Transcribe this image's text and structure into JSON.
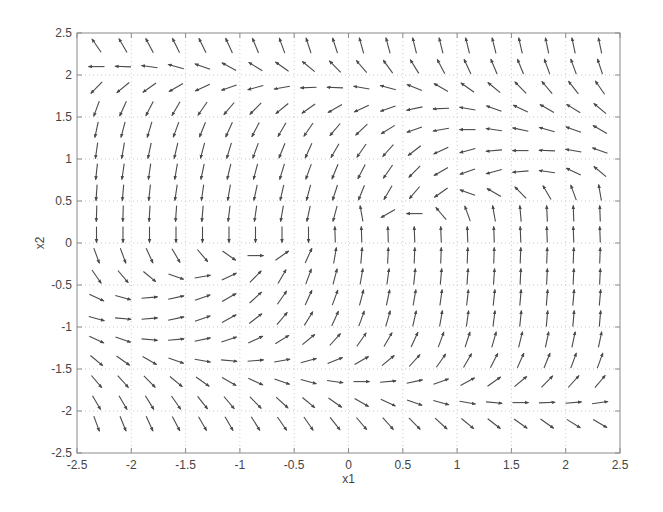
{
  "chart_data": {
    "type": "quiver",
    "title": "",
    "xlabel": "x1",
    "ylabel": "x2",
    "xlim": [
      -2.5,
      2.5
    ],
    "ylim": [
      -2.5,
      2.5
    ],
    "grid": true,
    "legend": null,
    "xticks": [
      -2.5,
      -2,
      -1.5,
      -1,
      -0.5,
      0,
      0.5,
      1,
      1.5,
      2,
      2.5
    ],
    "yticks": [
      -2.5,
      -2,
      -1.5,
      -1,
      -0.5,
      0,
      0.5,
      1,
      1.5,
      2,
      2.5
    ],
    "xtick_labels": [
      "-2.5",
      "-2",
      "-1.5",
      "-1",
      "-0.5",
      "0",
      "0.5",
      "1",
      "1.5",
      "2",
      "2.5"
    ],
    "ytick_labels": [
      "-2.5",
      "-2",
      "-1.5",
      "-1",
      "-0.5",
      "0",
      "0.5",
      "1",
      "1.5",
      "2",
      "2.5"
    ],
    "arrow_grid": {
      "x_start": -2.32,
      "x_step": 0.244,
      "nx": 20,
      "y_start": 2.35,
      "y_step": -0.25,
      "ny": 19,
      "note": "angles in degrees, 0 = +x1 (right), 90 = +x2 (up); rows top to bottom",
      "angles_deg": [
        [
          125,
          120,
          118,
          116,
          116,
          115,
          112,
          110,
          108,
          108,
          106,
          105,
          104,
          104,
          104,
          104,
          103,
          102,
          102,
          102
        ],
        [
          180,
          178,
          172,
          165,
          160,
          152,
          148,
          145,
          140,
          135,
          130,
          126,
          122,
          118,
          115,
          113,
          112,
          110,
          110,
          108
        ],
        [
          225,
          220,
          215,
          210,
          205,
          200,
          195,
          190,
          182,
          178,
          170,
          165,
          158,
          150,
          145,
          140,
          135,
          130,
          128,
          125
        ],
        [
          250,
          245,
          243,
          240,
          235,
          230,
          225,
          220,
          215,
          210,
          205,
          200,
          192,
          182,
          170,
          160,
          155,
          150,
          148,
          140
        ],
        [
          258,
          255,
          253,
          250,
          248,
          245,
          243,
          240,
          235,
          230,
          223,
          212,
          200,
          190,
          180,
          172,
          168,
          165,
          160,
          150
        ],
        [
          262,
          260,
          258,
          257,
          255,
          253,
          250,
          248,
          245,
          240,
          235,
          228,
          218,
          205,
          195,
          185,
          180,
          178,
          170,
          160
        ],
        [
          264,
          262,
          262,
          260,
          258,
          257,
          255,
          253,
          250,
          248,
          243,
          235,
          225,
          210,
          200,
          195,
          185,
          172,
          155,
          140
        ],
        [
          266,
          265,
          264,
          262,
          262,
          260,
          258,
          257,
          255,
          252,
          248,
          240,
          230,
          215,
          160,
          150,
          135,
          120,
          110,
          100
        ],
        [
          268,
          268,
          267,
          266,
          265,
          263,
          262,
          260,
          258,
          255,
          100,
          210,
          180,
          130,
          110,
          100,
          95,
          93,
          92,
          92
        ],
        [
          270,
          270,
          270,
          270,
          270,
          270,
          270,
          270,
          270,
          92,
          92,
          92,
          92,
          92,
          92,
          92,
          92,
          92,
          92,
          92
        ],
        [
          290,
          290,
          295,
          300,
          310,
          325,
          0,
          35,
          65,
          80,
          85,
          87,
          88,
          88,
          88,
          88,
          88,
          88,
          88,
          88
        ],
        [
          305,
          310,
          320,
          340,
          10,
          25,
          45,
          60,
          70,
          75,
          80,
          82,
          84,
          85,
          86,
          86,
          87,
          87,
          87,
          87
        ],
        [
          335,
          345,
          5,
          12,
          20,
          30,
          42,
          55,
          65,
          70,
          75,
          78,
          80,
          82,
          83,
          84,
          85,
          85,
          85,
          85
        ],
        [
          345,
          355,
          5,
          12,
          20,
          28,
          38,
          50,
          58,
          65,
          70,
          74,
          77,
          80,
          82,
          83,
          84,
          85,
          85,
          85
        ],
        [
          335,
          340,
          355,
          5,
          12,
          18,
          25,
          32,
          40,
          48,
          55,
          60,
          65,
          70,
          72,
          74,
          76,
          78,
          78,
          78
        ],
        [
          320,
          325,
          330,
          340,
          350,
          355,
          5,
          10,
          15,
          22,
          30,
          40,
          48,
          55,
          60,
          63,
          66,
          68,
          70,
          70
        ],
        [
          310,
          312,
          315,
          320,
          325,
          330,
          335,
          340,
          345,
          352,
          0,
          5,
          12,
          20,
          28,
          35,
          40,
          45,
          48,
          50
        ],
        [
          300,
          300,
          302,
          305,
          308,
          310,
          315,
          318,
          320,
          325,
          330,
          335,
          340,
          345,
          350,
          355,
          0,
          2,
          5,
          8
        ],
        [
          290,
          292,
          295,
          298,
          300,
          300,
          302,
          305,
          305,
          308,
          310,
          312,
          315,
          318,
          320,
          322,
          325,
          325,
          328,
          330
        ]
      ],
      "arrow_length_px": 16
    }
  },
  "colors": {
    "axes": "#8a8a8a",
    "grid": "#bdbdbd",
    "arrow": "#4a4a4a",
    "text": "#444444"
  }
}
